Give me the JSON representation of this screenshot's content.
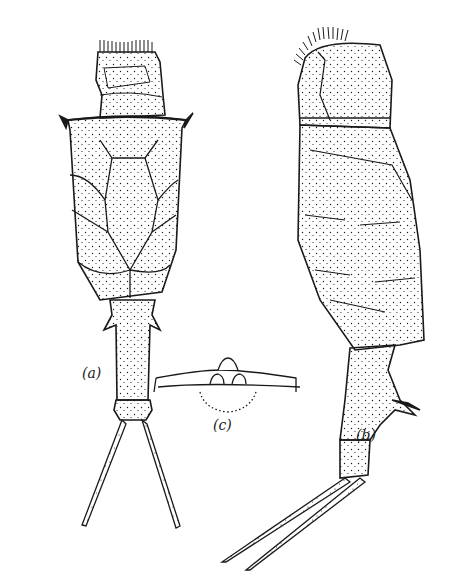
{
  "figure": {
    "ink_color": "#1a1a1a",
    "background": "#ffffff",
    "views": [
      {
        "id": "a",
        "label": "(a)",
        "description": "dorsal view"
      },
      {
        "id": "b",
        "label": "(b)",
        "description": "lateral view"
      },
      {
        "id": "c",
        "label": "(c)",
        "description": "detail of anterior margin"
      }
    ]
  }
}
